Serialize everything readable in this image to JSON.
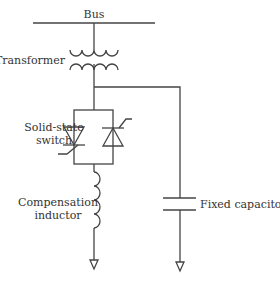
{
  "diagram": {
    "type": "circuit-schematic",
    "labels": {
      "bus": "Bus",
      "transformer": "Transformer",
      "switch_line1": "Solid-state",
      "switch_line2": "switch",
      "inductor_line1": "Compensation",
      "inductor_line2": "inductor",
      "capacitor": "Fixed capacitor"
    },
    "components": [
      {
        "id": "bus",
        "kind": "bus-bar"
      },
      {
        "id": "transformer",
        "kind": "transformer"
      },
      {
        "id": "solid-state-switch",
        "kind": "anti-parallel-thyristors"
      },
      {
        "id": "compensation-inductor",
        "kind": "inductor"
      },
      {
        "id": "fixed-capacitor",
        "kind": "capacitor"
      },
      {
        "id": "ground-left",
        "kind": "ground"
      },
      {
        "id": "ground-right",
        "kind": "ground"
      }
    ],
    "colors": {
      "line": "#444444",
      "text": "#333333",
      "background": "#ffffff"
    }
  }
}
